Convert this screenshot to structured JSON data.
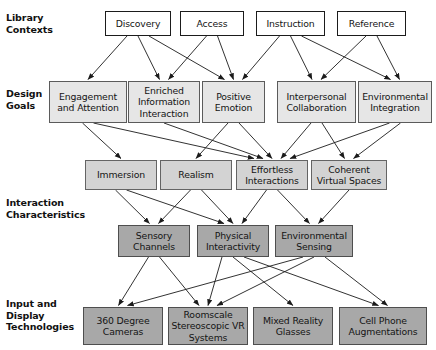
{
  "diagram": {
    "colors": {
      "level1_fill": "#ffffff",
      "level2_fill": "#e6e6e6",
      "level3_fill": "#d3d3d3",
      "level4_fill": "#a8a8a8",
      "level5_fill": "#a8a8a8",
      "stroke": "#1b1b1b",
      "background": "#ffffff"
    },
    "row_labels": [
      {
        "id": "library-contexts",
        "text": "Library\nContexts",
        "x": 6,
        "y": 12
      },
      {
        "id": "design-goals",
        "text": "Design\nGoals",
        "x": 6,
        "y": 88
      },
      {
        "id": "interaction-characteristics",
        "text": "Interaction\nCharacteristics",
        "x": 6,
        "y": 197
      },
      {
        "id": "input-display-technologies",
        "text": "Input and\nDisplay\nTechnologies",
        "x": 6,
        "y": 298
      }
    ],
    "nodes": [
      {
        "id": "discovery",
        "label": "Discovery",
        "level": 1,
        "x": 105,
        "y": 11,
        "w": 66,
        "h": 25
      },
      {
        "id": "access",
        "label": "Access",
        "level": 1,
        "x": 180,
        "y": 11,
        "w": 64,
        "h": 25
      },
      {
        "id": "instruction",
        "label": "Instruction",
        "level": 1,
        "x": 256,
        "y": 11,
        "w": 69,
        "h": 25
      },
      {
        "id": "reference",
        "label": "Reference",
        "level": 1,
        "x": 337,
        "y": 11,
        "w": 69,
        "h": 25
      },
      {
        "id": "engagement-and-attention",
        "label": "Engagement\nand Attention",
        "level": 2,
        "x": 49,
        "y": 81,
        "w": 78,
        "h": 42
      },
      {
        "id": "enriched-information-interaction",
        "label": "Enriched\nInformation\nInteraction",
        "level": 2,
        "x": 128,
        "y": 81,
        "w": 72,
        "h": 42
      },
      {
        "id": "positive-emotion",
        "label": "Positive\nEmotion",
        "level": 2,
        "x": 202,
        "y": 81,
        "w": 63,
        "h": 42
      },
      {
        "id": "interpersonal-collaboration",
        "label": "Interpersonal\nCollaboration",
        "level": 2,
        "x": 277,
        "y": 81,
        "w": 79,
        "h": 42
      },
      {
        "id": "environmental-integration",
        "label": "Environmental\nIntegration",
        "level": 2,
        "x": 358,
        "y": 81,
        "w": 74,
        "h": 42
      },
      {
        "id": "immersion",
        "label": "Immersion",
        "level": 3,
        "x": 85,
        "y": 160,
        "w": 72,
        "h": 30
      },
      {
        "id": "realism",
        "label": "Realism",
        "level": 3,
        "x": 160,
        "y": 160,
        "w": 72,
        "h": 30
      },
      {
        "id": "effortless-interactions",
        "label": "Effortless\nInteractions",
        "level": 3,
        "x": 236,
        "y": 160,
        "w": 72,
        "h": 30
      },
      {
        "id": "coherent-virtual-spaces",
        "label": "Coherent\nVirtual Spaces",
        "level": 3,
        "x": 311,
        "y": 160,
        "w": 76,
        "h": 30
      },
      {
        "id": "sensory-channels",
        "label": "Sensory\nChannels",
        "level": 4,
        "x": 118,
        "y": 225,
        "w": 72,
        "h": 32
      },
      {
        "id": "physical-interactivity",
        "label": "Physical\nInteractivity",
        "level": 4,
        "x": 197,
        "y": 225,
        "w": 72,
        "h": 32
      },
      {
        "id": "environmental-sensing",
        "label": "Environmental\nSensing",
        "level": 4,
        "x": 275,
        "y": 225,
        "w": 78,
        "h": 32
      },
      {
        "id": "360-degree-cameras",
        "label": "360 Degree\nCameras",
        "level": 5,
        "x": 83,
        "y": 307,
        "w": 80,
        "h": 38
      },
      {
        "id": "roomscale-stereoscopic-vr-systems",
        "label": "Roomscale\nStereoscopic VR\nSystems",
        "level": 5,
        "x": 168,
        "y": 307,
        "w": 80,
        "h": 38
      },
      {
        "id": "mixed-reality-glasses",
        "label": "Mixed Reality\nGlasses",
        "level": 5,
        "x": 253,
        "y": 307,
        "w": 80,
        "h": 38
      },
      {
        "id": "cell-phone-augmentations",
        "label": "Cell Phone\nAugmentations",
        "level": 5,
        "x": 339,
        "y": 307,
        "w": 88,
        "h": 38
      }
    ],
    "edges": [
      {
        "from": "discovery",
        "to": "engagement-and-attention"
      },
      {
        "from": "discovery",
        "to": "enriched-information-interaction"
      },
      {
        "from": "discovery",
        "to": "positive-emotion"
      },
      {
        "from": "access",
        "to": "enriched-information-interaction"
      },
      {
        "from": "access",
        "to": "positive-emotion"
      },
      {
        "from": "instruction",
        "to": "positive-emotion"
      },
      {
        "from": "instruction",
        "to": "interpersonal-collaboration"
      },
      {
        "from": "instruction",
        "to": "environmental-integration"
      },
      {
        "from": "reference",
        "to": "interpersonal-collaboration"
      },
      {
        "from": "reference",
        "to": "environmental-integration"
      },
      {
        "from": "engagement-and-attention",
        "to": "immersion"
      },
      {
        "from": "engagement-and-attention",
        "to": "effortless-interactions"
      },
      {
        "from": "enriched-information-interaction",
        "to": "effortless-interactions"
      },
      {
        "from": "positive-emotion",
        "to": "realism"
      },
      {
        "from": "positive-emotion",
        "to": "effortless-interactions"
      },
      {
        "from": "interpersonal-collaboration",
        "to": "effortless-interactions"
      },
      {
        "from": "interpersonal-collaboration",
        "to": "coherent-virtual-spaces"
      },
      {
        "from": "environmental-integration",
        "to": "effortless-interactions"
      },
      {
        "from": "environmental-integration",
        "to": "coherent-virtual-spaces"
      },
      {
        "from": "immersion",
        "to": "sensory-channels"
      },
      {
        "from": "immersion",
        "to": "physical-interactivity"
      },
      {
        "from": "realism",
        "to": "sensory-channels"
      },
      {
        "from": "realism",
        "to": "physical-interactivity"
      },
      {
        "from": "effortless-interactions",
        "to": "physical-interactivity"
      },
      {
        "from": "effortless-interactions",
        "to": "environmental-sensing"
      },
      {
        "from": "coherent-virtual-spaces",
        "to": "environmental-sensing"
      },
      {
        "from": "sensory-channels",
        "to": "360-degree-cameras"
      },
      {
        "from": "sensory-channels",
        "to": "roomscale-stereoscopic-vr-systems"
      },
      {
        "from": "physical-interactivity",
        "to": "roomscale-stereoscopic-vr-systems"
      },
      {
        "from": "physical-interactivity",
        "to": "mixed-reality-glasses"
      },
      {
        "from": "physical-interactivity",
        "to": "cell-phone-augmentations"
      },
      {
        "from": "environmental-sensing",
        "to": "360-degree-cameras"
      },
      {
        "from": "environmental-sensing",
        "to": "roomscale-stereoscopic-vr-systems"
      },
      {
        "from": "environmental-sensing",
        "to": "cell-phone-augmentations"
      }
    ]
  }
}
